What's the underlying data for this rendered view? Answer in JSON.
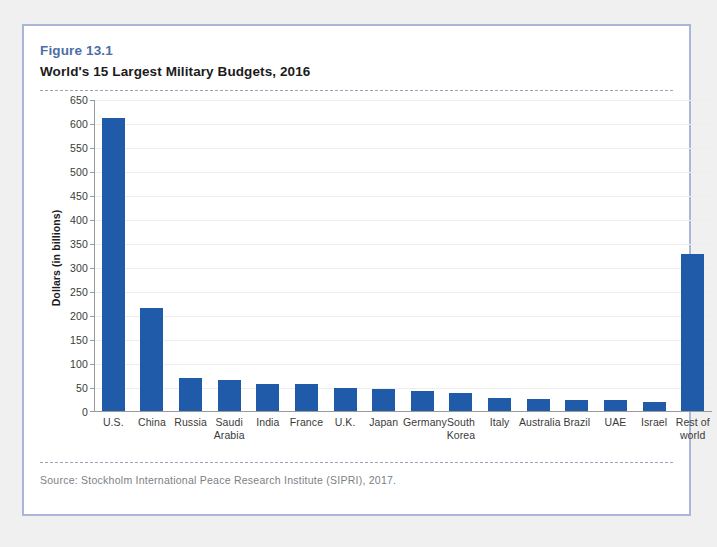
{
  "figure": {
    "number": "Figure 13.1",
    "title": "World's 15 Largest Military Budgets, 2016",
    "source": "Source:  Stockholm International Peace Research Institute (SIPRI), 2017."
  },
  "colors": {
    "bar": "#1f5ba8",
    "figure_number": "#4a6fa5",
    "card_border": "#a9b6d6",
    "gridline": "#ededed",
    "axis": "#9a9a9a",
    "page_background": "#f0f0f0",
    "card_background": "#ffffff"
  },
  "chart_data": {
    "type": "bar",
    "title": "World's 15 Largest Military Budgets, 2016",
    "xlabel": "",
    "ylabel": "Dollars (in billions)",
    "ylim": [
      0,
      650
    ],
    "ytick_step": 50,
    "yticks": [
      0,
      50,
      100,
      150,
      200,
      250,
      300,
      350,
      400,
      450,
      500,
      550,
      600,
      650
    ],
    "ytick_labels": [
      "0",
      "50",
      "100",
      "150",
      "200",
      "250",
      "300",
      "350",
      "400",
      "450",
      "500",
      "550",
      "600",
      "650"
    ],
    "grid": true,
    "legend": false,
    "categories": [
      "U.S.",
      "China",
      "Russia",
      "Saudi Arabia",
      "India",
      "France",
      "U.K.",
      "Japan",
      "Germany",
      "South Korea",
      "Italy",
      "Australia",
      "Brazil",
      "UAE",
      "Israel",
      "Rest of world"
    ],
    "values": [
      611,
      215,
      69,
      64,
      56,
      56,
      48,
      46,
      41,
      37,
      28,
      24,
      23,
      23,
      18,
      328
    ]
  }
}
